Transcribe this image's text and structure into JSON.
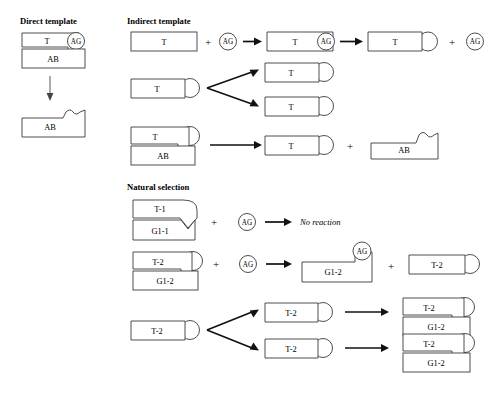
{
  "figure": {
    "background": "#ffffff",
    "stroke_color": "#3a3a3a",
    "arrow_color": "#111111"
  },
  "sections": [
    {
      "id": "direct",
      "heading": "Direct template",
      "x": 20,
      "y": 24
    },
    {
      "id": "indirect",
      "heading": "Indirect template",
      "x": 127,
      "y": 24
    },
    {
      "id": "natural",
      "heading": "Natural selection",
      "x": 127,
      "y": 188
    }
  ],
  "labels": {
    "T": "T",
    "AB": "AB",
    "AG": "AG",
    "T1": "T-1",
    "T2": "T-2",
    "G11": "G1-1",
    "G12": "G1-2",
    "plus": "+",
    "no_reaction": "No reaction"
  },
  "direct_template": {
    "heading": "Direct template",
    "reactant_top": {
      "label": "T",
      "adduct": "AG"
    },
    "reactant_bottom": {
      "label": "AB"
    },
    "arrow": "down",
    "product": {
      "label": "AB",
      "edge": "wavy-notch"
    }
  },
  "indirect_template": {
    "heading": "Indirect template",
    "row1": {
      "items": [
        {
          "type": "block",
          "label": "T"
        },
        {
          "type": "op",
          "label": "+"
        },
        {
          "type": "circle",
          "label": "AG"
        },
        {
          "type": "arrow"
        },
        {
          "type": "block",
          "label": "T",
          "adduct": "AG"
        },
        {
          "type": "arrow"
        },
        {
          "type": "block",
          "label": "T",
          "tail": "circle"
        },
        {
          "type": "op",
          "label": "+"
        },
        {
          "type": "circle",
          "label": "AG"
        }
      ]
    },
    "row2": {
      "source": {
        "label": "T",
        "tail": "circle"
      },
      "branch": "two",
      "products": [
        {
          "label": "T",
          "tail": "circle"
        },
        {
          "label": "T",
          "tail": "circle"
        }
      ]
    },
    "row3": {
      "source_top": {
        "label": "T",
        "tail": "circle"
      },
      "source_bottom": {
        "label": "AB"
      },
      "arrow": "right",
      "products": [
        {
          "label": "T",
          "tail": "circle"
        },
        {
          "type": "op",
          "label": "+"
        },
        {
          "label": "AB",
          "edge": "wavy-notch"
        }
      ]
    }
  },
  "natural_selection": {
    "heading": "Natural selection",
    "row1": {
      "duplex_top": {
        "label": "T-1",
        "tail": "point"
      },
      "duplex_bottom": {
        "label": "G1-1",
        "edge": "v-notch"
      },
      "op": "+",
      "reagent": "AG",
      "arrow": "right",
      "result": "No reaction"
    },
    "row2": {
      "duplex_top": {
        "label": "T-2",
        "tail": "circle"
      },
      "duplex_bottom": {
        "label": "G1-2"
      },
      "op": "+",
      "reagent": "AG",
      "arrow": "right",
      "products": [
        {
          "label": "G1-2",
          "adduct": "AG",
          "edge": "step"
        },
        {
          "type": "op",
          "label": "+"
        },
        {
          "label": "T-2",
          "tail": "circle"
        }
      ]
    },
    "row3": {
      "source": {
        "label": "T-2",
        "tail": "circle"
      },
      "branch": "two",
      "intermediates": [
        {
          "label": "T-2",
          "tail": "circle"
        },
        {
          "label": "T-2",
          "tail": "circle"
        }
      ],
      "products": [
        {
          "top": "T-2",
          "bottom": "G1-2"
        },
        {
          "top": "T-2",
          "bottom": "G1-2"
        }
      ]
    }
  }
}
